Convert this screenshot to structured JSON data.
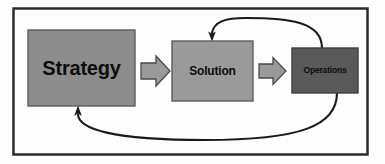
{
  "diagram": {
    "frame": {
      "border_color": "#2b2b2b",
      "background_color": "#fdfdfd"
    },
    "nodes": [
      {
        "id": "strategy",
        "label": "Strategy",
        "fill": "#8c8c8c",
        "stroke": "#5d5d5d",
        "x": 28,
        "y": 30,
        "width": 107,
        "height": 76
      },
      {
        "id": "solution",
        "label": "Solution",
        "fill": "#9a9a9a",
        "stroke": "#5d5d5d",
        "x": 172,
        "y": 41,
        "width": 81,
        "height": 60
      },
      {
        "id": "operations",
        "label": "Operations",
        "fill": "#5a5a5a",
        "stroke": "#3f3f3f",
        "x": 292,
        "y": 48,
        "width": 66,
        "height": 45
      }
    ],
    "block_arrows": [
      {
        "id": "strategy-to-solution",
        "from": "strategy",
        "to": "solution",
        "fill": "#9a9a9a",
        "stroke": "#4a4a4a"
      },
      {
        "id": "solution-to-operations",
        "from": "solution",
        "to": "operations",
        "fill": "#9a9a9a",
        "stroke": "#4a4a4a"
      }
    ],
    "feedback_curves": [
      {
        "id": "operations-to-solution",
        "from": "operations",
        "to": "solution",
        "position": "top",
        "stroke": "#1a1a1a"
      },
      {
        "id": "operations-to-strategy",
        "from": "operations",
        "to": "strategy",
        "position": "bottom",
        "stroke": "#1a1a1a"
      }
    ]
  }
}
